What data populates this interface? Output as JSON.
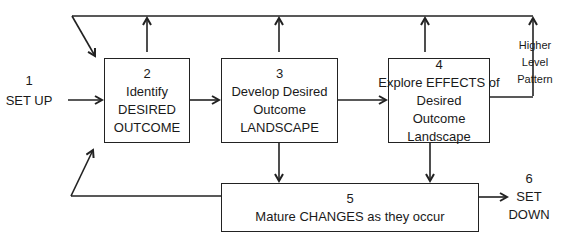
{
  "diagram": {
    "colors": {
      "line": "#222222",
      "text": "#1a1a1a",
      "background": "#ffffff"
    },
    "start": {
      "number": "1",
      "label": "SET UP"
    },
    "end": {
      "number": "6",
      "line1": "SET",
      "line2": "DOWN"
    },
    "higher_level": {
      "line1": "Higher",
      "line2": "Level",
      "line3": "Pattern"
    },
    "steps": [
      {
        "number": "2",
        "lines": [
          "Identify",
          "DESIRED",
          "OUTCOME"
        ]
      },
      {
        "number": "3",
        "lines": [
          "Develop Desired",
          "Outcome",
          "LANDSCAPE"
        ]
      },
      {
        "number": "4",
        "lines": [
          "Explore EFFECTS of",
          "Desired Outcome",
          "Landscape"
        ]
      },
      {
        "number": "5",
        "lines": [
          "Mature CHANGES as they occur"
        ]
      }
    ]
  }
}
